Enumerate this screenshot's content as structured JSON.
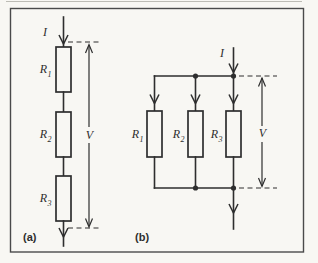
{
  "colors": {
    "paper": "#f8f7f3",
    "ink": "#2e2e2e",
    "frame": "#4a4a4a",
    "rule": "#bdbcb5"
  },
  "panels": {
    "a": {
      "caption": "(a)",
      "topology": "series",
      "current_label": "I",
      "voltage_label": "V",
      "resistors": [
        {
          "symbol": "R",
          "sub": "1"
        },
        {
          "symbol": "R",
          "sub": "2"
        },
        {
          "symbol": "R",
          "sub": "3"
        }
      ]
    },
    "b": {
      "caption": "(b)",
      "topology": "parallel",
      "current_label": "I",
      "voltage_label": "V",
      "resistors": [
        {
          "symbol": "R",
          "sub": "1"
        },
        {
          "symbol": "R",
          "sub": "2"
        },
        {
          "symbol": "R",
          "sub": "3"
        }
      ]
    }
  }
}
